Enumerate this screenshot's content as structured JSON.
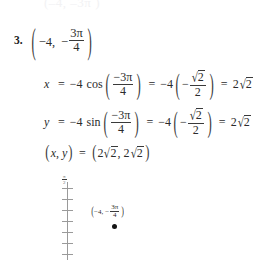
{
  "document": {
    "type": "textbook-solution",
    "ghost_top_line": "(–4,   –3π  )",
    "problem_number": "3.",
    "problem": {
      "open_paren": "(",
      "r": "−4",
      "comma": ",",
      "theta_sign": "−",
      "theta_num": "3π",
      "theta_den": "4",
      "close_paren": ")"
    },
    "equation_x": {
      "lhs": "x",
      "eq1": "=",
      "coef": "−4",
      "func": "cos",
      "open_paren": "(",
      "arg_num": "−3π",
      "arg_den": "4",
      "close_paren": ")",
      "eq2": "=",
      "coef2": "−4",
      "open_paren2": "(",
      "inner_sign": "−",
      "inner_num_surd": "√",
      "inner_num_rad": "2",
      "inner_den": "2",
      "close_paren2": ")",
      "eq3": "=",
      "result_coef": "2",
      "result_surd": "√",
      "result_rad": "2"
    },
    "equation_y": {
      "lhs": "y",
      "eq1": "=",
      "coef": "−4",
      "func": "sin",
      "open_paren": "(",
      "arg_num": "−3π",
      "arg_den": "4",
      "close_paren": ")",
      "eq2": "=",
      "coef2": "−4",
      "open_paren2": "(",
      "inner_sign": "−",
      "inner_num_surd": "√",
      "inner_num_rad": "2",
      "inner_den": "2",
      "close_paren2": ")",
      "eq3": "=",
      "result_coef": "2",
      "result_surd": "√",
      "result_rad": "2"
    },
    "equation_pair": {
      "open_paren": "(",
      "x": "x",
      "comma": ",",
      "y": "y",
      "close_paren": ")",
      "eq": "=",
      "open_paren2": "(",
      "val1_coef": "2",
      "val1_surd": "√",
      "val1_rad": "2",
      "comma2": ",",
      "val2_coef": "2",
      "val2_surd": "√",
      "val2_rad": "2",
      "close_paren2": ")"
    },
    "graph": {
      "axis_top_label_num": "π",
      "axis_top_label_den": "2",
      "point_label": {
        "open_paren": "(",
        "r": "−4",
        "comma": ",",
        "theta_sign": "−",
        "theta_num": "3π",
        "theta_den": "4",
        "close_paren": ")"
      },
      "tick_count": 7,
      "axis_color": "#9a9a9a",
      "point_color": "#141414"
    }
  }
}
